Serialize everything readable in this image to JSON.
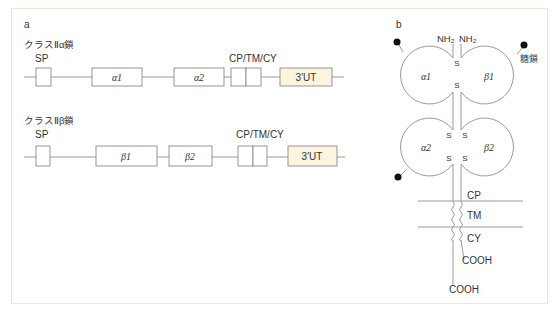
{
  "figure": {
    "frame_border_color": "#f3e6d6",
    "utr_fill_color": "#fbf5e0",
    "line_color": "#9a9a9a",
    "text_color": "#333333"
  },
  "panel_a": {
    "label": "a",
    "alpha_chain": {
      "title": "クラスⅡα鎖",
      "sp_label": "SP",
      "cp_tm_cy_label": "CP/TM/CY",
      "domains": [
        {
          "id": "sp",
          "label": "",
          "x": 36,
          "w": 15
        },
        {
          "id": "alpha1",
          "label": "α1",
          "x": 92,
          "w": 50
        },
        {
          "id": "alpha2",
          "label": "α2",
          "x": 203,
          "w": 50
        },
        {
          "id": "cp-tm-cy",
          "label": "",
          "x": 231,
          "w": 30,
          "split": true
        },
        {
          "id": "utr",
          "label": "3′UT",
          "x": 280,
          "w": 52
        }
      ]
    },
    "beta_chain": {
      "title": "クラスⅡβ鎖",
      "sp_label": "SP",
      "cp_tm_cy_label": "CP/TM/CY",
      "domains": [
        {
          "id": "sp",
          "label": "",
          "x": 36,
          "w": 14
        },
        {
          "id": "beta1",
          "label": "β1",
          "x": 96,
          "w": 61
        },
        {
          "id": "beta2",
          "label": "β2",
          "x": 169,
          "w": 43
        },
        {
          "id": "cp-tm-cy",
          "label": "",
          "x": 238,
          "w": 29,
          "split": true
        },
        {
          "id": "utr",
          "label": "3′UT",
          "x": 288,
          "w": 49
        }
      ]
    }
  },
  "panel_b": {
    "label": "b",
    "nh2_left": "NH₂",
    "nh2_right": "NH₂",
    "domain_alpha1": "α1",
    "domain_beta1": "β1",
    "domain_alpha2": "α2",
    "domain_beta2": "β2",
    "glycan_label": "糖鎖",
    "disulfide_s": "S",
    "region_cp": "CP",
    "region_tm": "TM",
    "region_cy": "CY",
    "cooh_beta": "COOH",
    "cooh_alpha": "COOH"
  }
}
